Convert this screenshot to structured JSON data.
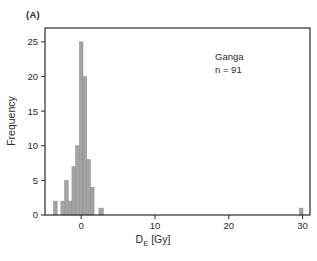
{
  "panel_label": "(A)",
  "annotation": {
    "line1": "Ganga",
    "line2": "n = 91"
  },
  "axes": {
    "ylabel": "Frequency",
    "xlabel_main": "D",
    "xlabel_sub": "E",
    "xlabel_unit": " [Gy]"
  },
  "chart_data": {
    "type": "bar",
    "title": "",
    "xlabel": "DE [Gy]",
    "ylabel": "Frequency",
    "annotation": "Ganga n = 91",
    "sample_size": 91,
    "x_ticks": [
      0,
      10,
      20,
      30
    ],
    "y_ticks": [
      0,
      5,
      10,
      15,
      20,
      25
    ],
    "xlim": [
      -4.9,
      31
    ],
    "ylim": [
      0,
      27
    ],
    "grid": false,
    "bar_color": "#a4a4a4",
    "bar_edge_color": "#8e8e8e",
    "frame_color": "#2b2b2b",
    "bars": [
      {
        "x": -3.5,
        "width": 0.5,
        "freq": 2
      },
      {
        "x": -2.5,
        "width": 0.5,
        "freq": 2
      },
      {
        "x": -2.0,
        "width": 0.5,
        "freq": 5
      },
      {
        "x": -1.5,
        "width": 0.5,
        "freq": 2
      },
      {
        "x": -1.0,
        "width": 0.5,
        "freq": 7
      },
      {
        "x": -0.5,
        "width": 0.5,
        "freq": 10
      },
      {
        "x": 0.0,
        "width": 0.5,
        "freq": 25
      },
      {
        "x": 0.5,
        "width": 0.5,
        "freq": 20
      },
      {
        "x": 1.0,
        "width": 0.5,
        "freq": 8
      },
      {
        "x": 1.5,
        "width": 0.5,
        "freq": 4
      },
      {
        "x": 2.7,
        "width": 0.6,
        "freq": 1
      },
      {
        "x": 29.8,
        "width": 0.5,
        "freq": 1
      }
    ]
  }
}
